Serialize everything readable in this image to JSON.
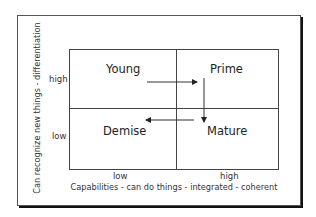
{
  "diagram": {
    "type": "2x2 matrix",
    "quadrants": {
      "top_left": "Young",
      "top_right": "Prime",
      "bottom_left": "Demise",
      "bottom_right": "Mature"
    },
    "y_axis": {
      "label": "Can recognize new things - differentiation",
      "ticks": {
        "high": "high",
        "low": "low"
      }
    },
    "x_axis": {
      "label": "Capabilities - can do things - integrated - coherent",
      "ticks": {
        "low": "low",
        "high": "high"
      }
    },
    "arrows": [
      {
        "from": "Young",
        "to": "Prime",
        "direction": "right"
      },
      {
        "from": "Prime",
        "to": "Mature",
        "direction": "down"
      },
      {
        "from": "Mature",
        "to": "Demise",
        "direction": "left"
      }
    ],
    "colors": {
      "line": "#444444",
      "text": "#222222",
      "background": "#ffffff"
    }
  }
}
